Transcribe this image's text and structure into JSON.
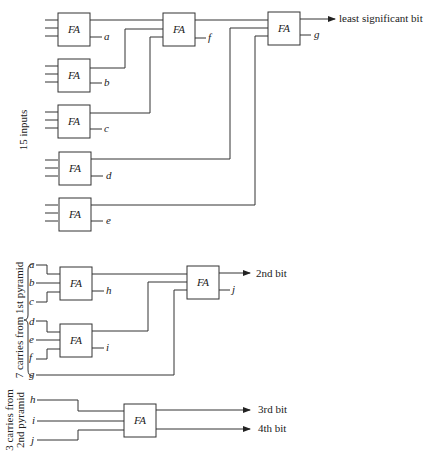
{
  "diagram": {
    "block_label": "FA",
    "section1": {
      "side_label": "15 inputs",
      "outputs": {
        "lsb": "least significant bit"
      },
      "carries": [
        "a",
        "b",
        "c",
        "d",
        "e",
        "f",
        "g"
      ]
    },
    "section2": {
      "side_label": "7 carries from 1st pyramid",
      "inputs": [
        "a",
        "b",
        "c",
        "d",
        "e",
        "f",
        "g"
      ],
      "carries": [
        "h",
        "i",
        "j"
      ],
      "outputs": {
        "bit2": "2nd bit"
      }
    },
    "section3": {
      "side_label_line1": "3 carries from",
      "side_label_line2": "2nd pyramid",
      "inputs": [
        "h",
        "i",
        "j"
      ],
      "outputs": {
        "bit3": "3rd bit",
        "bit4": "4th bit"
      }
    }
  }
}
